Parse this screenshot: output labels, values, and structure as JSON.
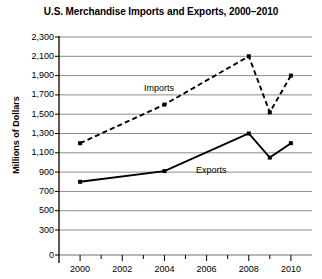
{
  "chart_data": {
    "type": "line",
    "title": "U.S. Merchandise Imports and Exports, 2000–2010",
    "xlabel": "",
    "ylabel": "Millions of Dollars",
    "x": [
      2000,
      2004,
      2008,
      2009,
      2010
    ],
    "xlim": [
      1999,
      2011
    ],
    "ylim": [
      0,
      2300
    ],
    "grid": true,
    "legend_position": "inline-annotations",
    "xticks": [
      "2000",
      "2002",
      "2004",
      "2006",
      "2008",
      "2010"
    ],
    "xtick_values": [
      2000,
      2002,
      2004,
      2006,
      2008,
      2010
    ],
    "yticks": [
      "0",
      "300",
      "500",
      "700",
      "900",
      "1,100",
      "1,300",
      "1,500",
      "1,700",
      "1,900",
      "2,100",
      "2,300"
    ],
    "ytick_values": [
      0,
      300,
      500,
      700,
      900,
      1100,
      1300,
      1500,
      1700,
      1900,
      2100,
      2300
    ],
    "axis_break_note": "y-axis compressed between 0 and 300",
    "series": [
      {
        "name": "Imports",
        "style": "dashed",
        "color": "#000000",
        "values": [
          1200,
          1600,
          2100,
          1520,
          1900
        ]
      },
      {
        "name": "Exports",
        "style": "solid",
        "color": "#000000",
        "values": [
          800,
          910,
          1300,
          1050,
          1200
        ]
      }
    ],
    "annotations": [
      {
        "text": "Imports",
        "x": 2004.4,
        "y": 1760
      },
      {
        "text": "Exports",
        "x": 2006.2,
        "y": 1010
      }
    ]
  }
}
